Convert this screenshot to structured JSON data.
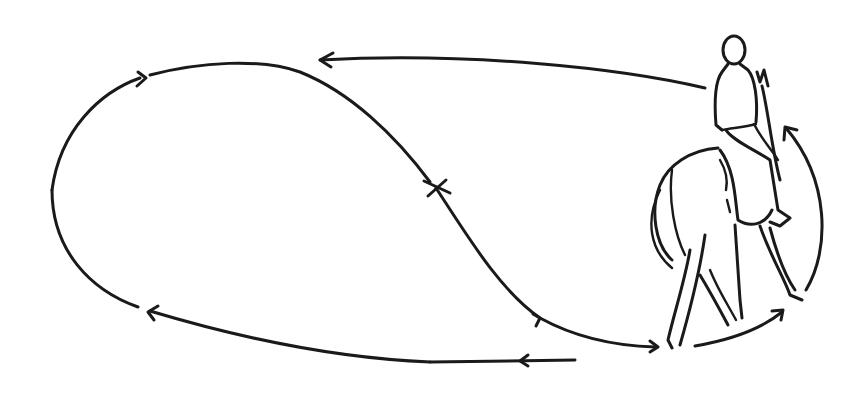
{
  "diagram": {
    "description": "Riding figure: horse and rider seen from behind on a looping path with directional arrows and an X crossing marker",
    "colors": {
      "ink": "#1a1a1a",
      "background": "#ffffff"
    },
    "elements": {
      "path": "loop-path",
      "marker": "X",
      "figure": "horse-and-rider"
    }
  }
}
